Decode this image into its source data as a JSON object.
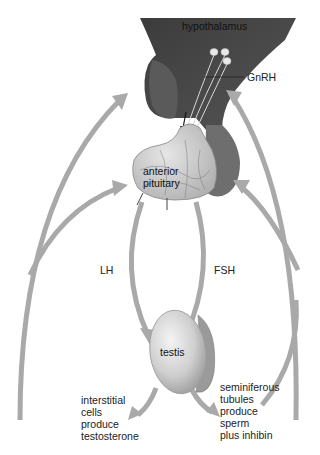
{
  "diagram": {
    "labels": {
      "hypothalamus": "hypothalamus",
      "gnrh": "GnRH",
      "anterior_pituitary_line1": "anterior",
      "anterior_pituitary_line2": "pituitary",
      "lh": "LH",
      "fsh": "FSH",
      "testis": "testis"
    },
    "left_caption": [
      "interstitial",
      "cells",
      "produce",
      "testosterone"
    ],
    "right_caption": [
      "seminiferous",
      "tubules",
      "produce",
      "sperm",
      "plus inhibin"
    ],
    "colors": {
      "hypothalamus": "#4a4a4a",
      "pituitary_posterior": "#6e6e6e",
      "pituitary_anterior": "#c8c8c8",
      "arrow": "#a9a9a9",
      "testis": "#d6d6d6",
      "text": "#222222"
    }
  }
}
